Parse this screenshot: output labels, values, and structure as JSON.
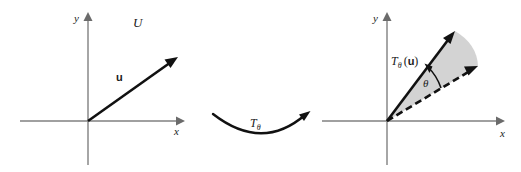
{
  "figure": {
    "background_color": "#ffffff",
    "width": 521,
    "height": 172
  },
  "colors": {
    "axis": "#808080",
    "vector": "#111111",
    "sector_fill": "#d3d3d3",
    "text": "#1a1a1a"
  },
  "left_panel": {
    "name": "domain-plane",
    "set_label": "U",
    "axis_x_label": "x",
    "axis_y_label": "y",
    "origin_label": "O",
    "vector_label": "u",
    "vector": {
      "origin": [
        88,
        121
      ],
      "tip": [
        178,
        57
      ]
    },
    "axes": {
      "x_range": [
        20,
        182
      ],
      "y_range": [
        10,
        165
      ],
      "origin": [
        88,
        121
      ]
    }
  },
  "middle_panel": {
    "name": "transformation-arrow",
    "map_label": "T",
    "map_subscript": "θ",
    "curve": {
      "start": [
        213,
        114
      ],
      "control": [
        262,
        152
      ],
      "end": [
        310,
        112
      ]
    }
  },
  "right_panel": {
    "name": "codomain-plane",
    "axis_x_label": "x",
    "axis_y_label": "y",
    "image_label_base": "T",
    "image_label_subscript": "θ",
    "image_label_open": "(",
    "image_label_vector": "u",
    "image_label_close": ")",
    "angle_label": "θ",
    "rotated_vector": {
      "origin": [
        387,
        121
      ],
      "tip": [
        455,
        31
      ]
    },
    "original_vector": {
      "origin": [
        387,
        121
      ],
      "tip": [
        478,
        66
      ],
      "style": "dashed"
    },
    "axes": {
      "x_range": [
        322,
        505
      ],
      "y_range": [
        10,
        165
      ],
      "origin": [
        387,
        121
      ]
    }
  }
}
